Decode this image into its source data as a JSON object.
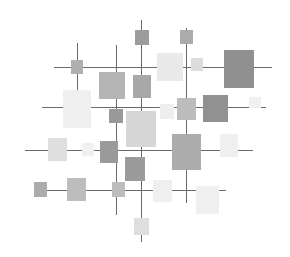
{
  "artwork": {
    "description": "Abstract grid composition of gray squares on intersecting lines",
    "background": "#ffffff",
    "line_color": "#6a6a6a",
    "hlines": [
      {
        "x1": 54,
        "x2": 272,
        "y": 67
      },
      {
        "x1": 42,
        "x2": 266,
        "y": 107
      },
      {
        "x1": 25,
        "x2": 253,
        "y": 150
      },
      {
        "x1": 34,
        "x2": 226,
        "y": 190
      }
    ],
    "vlines": [
      {
        "x": 77,
        "y1": 43,
        "y2": 91
      },
      {
        "x": 116,
        "y1": 45,
        "y2": 215
      },
      {
        "x": 141,
        "y1": 20,
        "y2": 242
      },
      {
        "x": 186,
        "y1": 28,
        "y2": 203
      }
    ],
    "squares": [
      {
        "x": 135,
        "y": 30,
        "w": 14,
        "h": 15,
        "color": "#9c9c9c"
      },
      {
        "x": 180,
        "y": 30,
        "w": 13,
        "h": 14,
        "color": "#ababab"
      },
      {
        "x": 71,
        "y": 60,
        "w": 12,
        "h": 14,
        "color": "#b0b0b0"
      },
      {
        "x": 99,
        "y": 72,
        "w": 26,
        "h": 27,
        "color": "#b5b5b5"
      },
      {
        "x": 133,
        "y": 75,
        "w": 18,
        "h": 23,
        "color": "#a8a8a8"
      },
      {
        "x": 157,
        "y": 53,
        "w": 26,
        "h": 28,
        "color": "#e9e9e9"
      },
      {
        "x": 191,
        "y": 58,
        "w": 12,
        "h": 13,
        "color": "#dcdcdc"
      },
      {
        "x": 224,
        "y": 50,
        "w": 30,
        "h": 38,
        "color": "#909090"
      },
      {
        "x": 63,
        "y": 90,
        "w": 28,
        "h": 38,
        "color": "#efefef"
      },
      {
        "x": 109,
        "y": 109,
        "w": 14,
        "h": 14,
        "color": "#999999"
      },
      {
        "x": 126,
        "y": 111,
        "w": 30,
        "h": 36,
        "color": "#d6d6d6"
      },
      {
        "x": 160,
        "y": 104,
        "w": 14,
        "h": 15,
        "color": "#eeeeee"
      },
      {
        "x": 177,
        "y": 98,
        "w": 19,
        "h": 22,
        "color": "#bcbcbc"
      },
      {
        "x": 203,
        "y": 95,
        "w": 25,
        "h": 27,
        "color": "#919191"
      },
      {
        "x": 249,
        "y": 97,
        "w": 12,
        "h": 11,
        "color": "#f0f0f0"
      },
      {
        "x": 48,
        "y": 138,
        "w": 19,
        "h": 23,
        "color": "#dedede"
      },
      {
        "x": 82,
        "y": 143,
        "w": 12,
        "h": 13,
        "color": "#f0f0f0"
      },
      {
        "x": 100,
        "y": 141,
        "w": 18,
        "h": 22,
        "color": "#9a9a9a"
      },
      {
        "x": 125,
        "y": 157,
        "w": 20,
        "h": 24,
        "color": "#9b9b9b"
      },
      {
        "x": 172,
        "y": 134,
        "w": 29,
        "h": 36,
        "color": "#acacac"
      },
      {
        "x": 220,
        "y": 134,
        "w": 18,
        "h": 23,
        "color": "#efefef"
      },
      {
        "x": 34,
        "y": 182,
        "w": 13,
        "h": 15,
        "color": "#acacac"
      },
      {
        "x": 67,
        "y": 178,
        "w": 19,
        "h": 23,
        "color": "#bdbdbd"
      },
      {
        "x": 112,
        "y": 182,
        "w": 13,
        "h": 15,
        "color": "#bcbcbc"
      },
      {
        "x": 153,
        "y": 180,
        "w": 19,
        "h": 22,
        "color": "#efefef"
      },
      {
        "x": 196,
        "y": 186,
        "w": 23,
        "h": 28,
        "color": "#f0f0f0"
      },
      {
        "x": 134,
        "y": 218,
        "w": 15,
        "h": 17,
        "color": "#dedede"
      }
    ]
  }
}
